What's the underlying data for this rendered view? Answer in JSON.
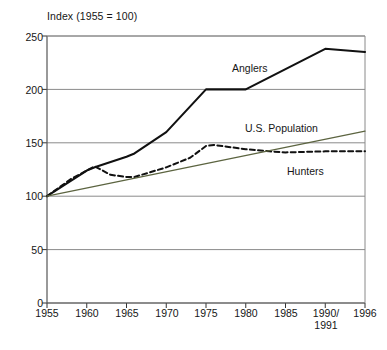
{
  "chart_data": {
    "type": "line",
    "title": "Index (1955 = 100)",
    "xlabel": "",
    "ylabel": "",
    "ylim": [
      0,
      250
    ],
    "yticks": [
      0,
      50,
      100,
      150,
      200,
      250
    ],
    "grid": true,
    "legend_position": "inline-annotations",
    "x": [
      "1955",
      "1960",
      "1965",
      "1970",
      "1975",
      "1980",
      "1985",
      "1990/1991",
      "1996"
    ],
    "x_tick_labels": [
      {
        "line1": "1955",
        "line2": ""
      },
      {
        "line1": "1960",
        "line2": ""
      },
      {
        "line1": "1965",
        "line2": ""
      },
      {
        "line1": "1970",
        "line2": ""
      },
      {
        "line1": "1975",
        "line2": ""
      },
      {
        "line1": "1980",
        "line2": ""
      },
      {
        "line1": "1985",
        "line2": ""
      },
      {
        "line1": "1990/",
        "line2": "1991"
      },
      {
        "line1": "1996",
        "line2": ""
      }
    ],
    "series": [
      {
        "name": "Anglers",
        "style": "solid",
        "color": "#111111",
        "points": [
          {
            "year": 1955,
            "value": 100
          },
          {
            "year": 1960,
            "value": 124
          },
          {
            "year": 1961,
            "value": 127
          },
          {
            "year": 1965,
            "value": 137
          },
          {
            "year": 1966,
            "value": 140
          },
          {
            "year": 1970,
            "value": 160
          },
          {
            "year": 1975,
            "value": 200
          },
          {
            "year": 1980,
            "value": 200
          },
          {
            "year": 1991,
            "value": 238
          },
          {
            "year": 1996,
            "value": 235
          }
        ]
      },
      {
        "name": "Hunters",
        "style": "dashed",
        "color": "#111111",
        "points": [
          {
            "year": 1955,
            "value": 100
          },
          {
            "year": 1958,
            "value": 116
          },
          {
            "year": 1960,
            "value": 124
          },
          {
            "year": 1961,
            "value": 128
          },
          {
            "year": 1963,
            "value": 120
          },
          {
            "year": 1965,
            "value": 118
          },
          {
            "year": 1966,
            "value": 118
          },
          {
            "year": 1970,
            "value": 127
          },
          {
            "year": 1973,
            "value": 136
          },
          {
            "year": 1975,
            "value": 147
          },
          {
            "year": 1976,
            "value": 148
          },
          {
            "year": 1980,
            "value": 144
          },
          {
            "year": 1983,
            "value": 142
          },
          {
            "year": 1985,
            "value": 141
          },
          {
            "year": 1991,
            "value": 142
          },
          {
            "year": 1996,
            "value": 142
          }
        ]
      },
      {
        "name": "U.S. Population",
        "style": "solid-thin",
        "color": "#5c6440",
        "points": [
          {
            "year": 1955,
            "value": 100
          },
          {
            "year": 1996,
            "value": 161
          }
        ]
      }
    ],
    "annotations": [
      {
        "text": "Anglers",
        "x": 232,
        "y": 62
      },
      {
        "text": "U.S. Population",
        "x": 245,
        "y": 122
      },
      {
        "text": "Hunters",
        "x": 287,
        "y": 165
      }
    ]
  },
  "axis": {
    "title": "Index (1955 = 100)",
    "y_labels": [
      "250",
      "200",
      "150",
      "100",
      "50",
      "0"
    ]
  }
}
